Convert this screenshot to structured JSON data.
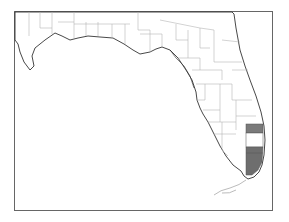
{
  "map": {
    "region": "Florida",
    "subdivision": "counties",
    "frame_color": "#666666",
    "land_fill": "#ffffff",
    "county_line_color": "#b5b5b5",
    "coast_color": "#333333",
    "shaded_counties": [
      {
        "name": "Palm Beach",
        "fill": "#7a7a7a"
      },
      {
        "name": "Broward",
        "fill": "#ffffff"
      },
      {
        "name": "Miami-Dade",
        "fill": "#6e6e6e"
      }
    ]
  }
}
